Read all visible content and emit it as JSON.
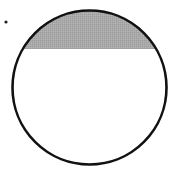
{
  "diagram": {
    "type": "circle-segment",
    "circle": {
      "cx": 89.5,
      "cy": 87.5,
      "r": 77,
      "stroke": "#111111",
      "stroke_width": 2.6,
      "fill": "#ffffff"
    },
    "chord_y": 49,
    "shaded_segment": {
      "fill": "#a9a9a9",
      "position": "top"
    },
    "point": {
      "cx": 6,
      "cy": 22,
      "r": 1.6,
      "fill": "#222222"
    }
  }
}
